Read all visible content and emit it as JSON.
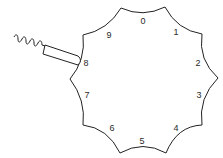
{
  "diagram": {
    "stroke_color": "#222222",
    "background": "#ffffff",
    "labels": [
      {
        "text": "0",
        "x": 143,
        "y": 24
      },
      {
        "text": "1",
        "x": 176,
        "y": 35
      },
      {
        "text": "2",
        "x": 198,
        "y": 66
      },
      {
        "text": "3",
        "x": 199,
        "y": 98
      },
      {
        "text": "4",
        "x": 176,
        "y": 131
      },
      {
        "text": "5",
        "x": 142,
        "y": 144
      },
      {
        "text": "6",
        "x": 112,
        "y": 131
      },
      {
        "text": "7",
        "x": 87,
        "y": 98
      },
      {
        "text": "8",
        "x": 86,
        "y": 66
      },
      {
        "text": "9",
        "x": 109,
        "y": 38
      }
    ],
    "plunger": {
      "label": "spring plunger",
      "contacts_position": "8"
    }
  }
}
